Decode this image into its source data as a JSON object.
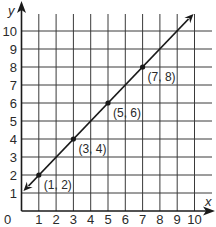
{
  "chart_data": {
    "type": "line",
    "title": "",
    "xlabel": "x",
    "ylabel": "y",
    "xlim": [
      0,
      11
    ],
    "ylim": [
      0,
      11
    ],
    "grid": true,
    "x_ticks": [
      "1",
      "2",
      "3",
      "4",
      "5",
      "6",
      "7",
      "8",
      "9",
      "10"
    ],
    "y_ticks": [
      "1",
      "2",
      "3",
      "4",
      "5",
      "6",
      "7",
      "8",
      "9",
      "10"
    ],
    "origin_label": "0",
    "series": [
      {
        "name": "y = x + 1",
        "x": [
          1,
          3,
          5,
          7
        ],
        "y": [
          2,
          4,
          6,
          8
        ],
        "line_extends": {
          "from": [
            0,
            1
          ],
          "to": [
            10,
            11
          ]
        },
        "arrows_both_ends": true
      }
    ],
    "annotations": [
      {
        "text": "(1, 2)",
        "x": 1,
        "y": 2
      },
      {
        "text": "(3, 4)",
        "x": 3,
        "y": 4
      },
      {
        "text": "(5, 6)",
        "x": 5,
        "y": 6
      },
      {
        "text": "(7, 8)",
        "x": 7,
        "y": 8
      }
    ],
    "colors": {
      "line": "#1a1a1a",
      "grid": "#3a3a3a",
      "text": "#2a2a2a"
    }
  }
}
